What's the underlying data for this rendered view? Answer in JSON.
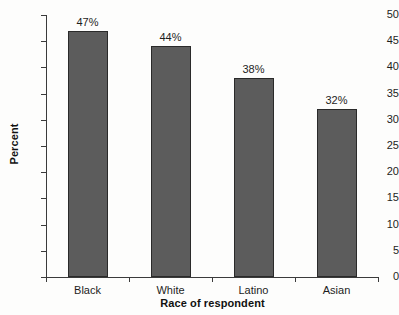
{
  "chart_data": {
    "type": "bar",
    "title": "",
    "subtitle": "",
    "categories": [
      "Black",
      "White",
      "Latino",
      "Asian"
    ],
    "values": [
      47,
      44,
      38,
      32
    ],
    "data_labels": [
      "47%",
      "44%",
      "38%",
      "32%"
    ],
    "xlabel": "Race of respondent",
    "ylabel": "Percent",
    "ylim": [
      0,
      50
    ],
    "ytick_values": [
      0,
      5,
      10,
      15,
      20,
      25,
      30,
      35,
      40,
      45,
      50
    ],
    "ytick_labels": [
      "0",
      "5",
      "10",
      "15",
      "20",
      "25",
      "30",
      "35",
      "40",
      "45",
      "50"
    ],
    "grid": false,
    "legend": null,
    "bar_color": "#5c5c5c",
    "bar_edge_color": "#2a2a2a",
    "axis_color": "#3b3b3b",
    "background_color": "#fdfdfc",
    "text_color": "#1d1d1d"
  }
}
